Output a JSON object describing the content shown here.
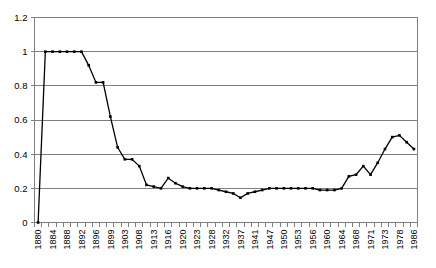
{
  "chart_data": {
    "type": "line",
    "title": "",
    "subtitle": "",
    "xlabel": "",
    "ylabel": "",
    "ylim": [
      0,
      1.2
    ],
    "ytick_labels": [
      "0",
      "0.2",
      "0.4",
      "0.6",
      "0.8",
      "1",
      "1.2"
    ],
    "ytick_values": [
      0,
      0.2,
      0.4,
      0.6,
      0.8,
      1,
      1.2
    ],
    "grid": "horizontal",
    "legend": "none",
    "markers": "square",
    "line_color": "#000000",
    "grid_color": "#808080",
    "axis_color": "#808080",
    "plot_background": "#ffffff",
    "categories": [
      "1880",
      "1881",
      "1884",
      "1886",
      "1888",
      "1890",
      "1892",
      "1894",
      "1896",
      "1898",
      "1899",
      "1901",
      "1903",
      "1905",
      "1908",
      "1910",
      "1913",
      "1915",
      "1916",
      "1918",
      "1920",
      "1922",
      "1923",
      "1925",
      "1928",
      "1930",
      "1932",
      "1934",
      "1937",
      "1939",
      "1941",
      "1944",
      "1947",
      "1949",
      "1950",
      "1952",
      "1953",
      "1955",
      "1956",
      "1958",
      "1960",
      "1962",
      "1964",
      "1966",
      "1968",
      "1970",
      "1971",
      "1972",
      "1973",
      "1975",
      "1978",
      "1982",
      "1986"
    ],
    "xtick_labels_shown": [
      "1880",
      "1884",
      "1888",
      "1892",
      "1896",
      "1899",
      "1903",
      "1908",
      "1913",
      "1916",
      "1920",
      "1923",
      "1928",
      "1932",
      "1937",
      "1941",
      "1947",
      "1950",
      "1953",
      "1956",
      "1960",
      "1964",
      "1968",
      "1971",
      "1973",
      "1978",
      "1986"
    ],
    "values": [
      0.0,
      1.0,
      1.0,
      1.0,
      1.0,
      1.0,
      1.0,
      0.92,
      0.82,
      0.82,
      0.62,
      0.44,
      0.37,
      0.37,
      0.33,
      0.22,
      0.21,
      0.2,
      0.26,
      0.23,
      0.21,
      0.2,
      0.2,
      0.2,
      0.2,
      0.19,
      0.18,
      0.17,
      0.145,
      0.17,
      0.18,
      0.19,
      0.2,
      0.2,
      0.2,
      0.2,
      0.2,
      0.2,
      0.2,
      0.19,
      0.19,
      0.19,
      0.2,
      0.27,
      0.28,
      0.33,
      0.28,
      0.35,
      0.43,
      0.5,
      0.51,
      0.47,
      0.43
    ],
    "series": [
      {
        "name": "series-1",
        "values": [
          0.0,
          1.0,
          1.0,
          1.0,
          1.0,
          1.0,
          1.0,
          0.92,
          0.82,
          0.82,
          0.62,
          0.44,
          0.37,
          0.37,
          0.33,
          0.22,
          0.21,
          0.2,
          0.26,
          0.23,
          0.21,
          0.2,
          0.2,
          0.2,
          0.2,
          0.19,
          0.18,
          0.17,
          0.145,
          0.17,
          0.18,
          0.19,
          0.2,
          0.2,
          0.2,
          0.2,
          0.2,
          0.2,
          0.2,
          0.19,
          0.19,
          0.19,
          0.2,
          0.27,
          0.28,
          0.33,
          0.28,
          0.35,
          0.43,
          0.5,
          0.51,
          0.47,
          0.43
        ]
      }
    ]
  }
}
